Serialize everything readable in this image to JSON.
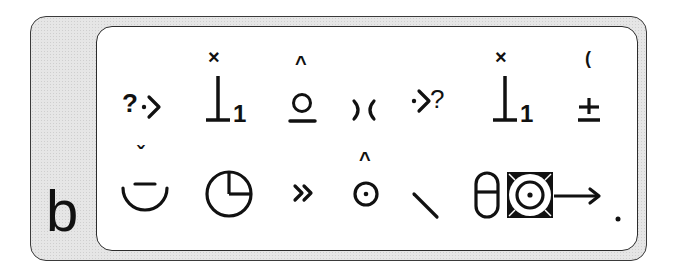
{
  "figure": {
    "panel_label": "b",
    "background_fill": "#e6e6e6",
    "panel_fill": "#ffffff",
    "ink_color": "#111111"
  },
  "rows": [
    {
      "symbols": [
        {
          "name": "question-dot-chevron-right",
          "text": "?·>"
        },
        {
          "name": "up-tack-subscript-1",
          "text": "1",
          "diacritic_above": "×"
        },
        {
          "name": "underlined-circle",
          "diacritic_above": "^"
        },
        {
          "name": "reversed-parentheses",
          "text": ")("
        },
        {
          "name": "dot-chevron-right-question",
          "text": "·>?"
        },
        {
          "name": "up-tack-subscript-1",
          "text": "1",
          "diacritic_above": "×"
        },
        {
          "name": "plus-minus",
          "text": "±",
          "diacritic_above": "("
        }
      ]
    },
    {
      "symbols": [
        {
          "name": "smile-arc-with-bar",
          "diacritic_above": "ˇ"
        },
        {
          "name": "clock-quarter-circle"
        },
        {
          "name": "double-chevron-right",
          "text": "»"
        },
        {
          "name": "dotted-circle",
          "diacritic_above": "^"
        },
        {
          "name": "diagonal-stroke"
        },
        {
          "name": "pill-square-target-arrow"
        },
        {
          "name": "period-dot",
          "text": "."
        }
      ]
    }
  ]
}
